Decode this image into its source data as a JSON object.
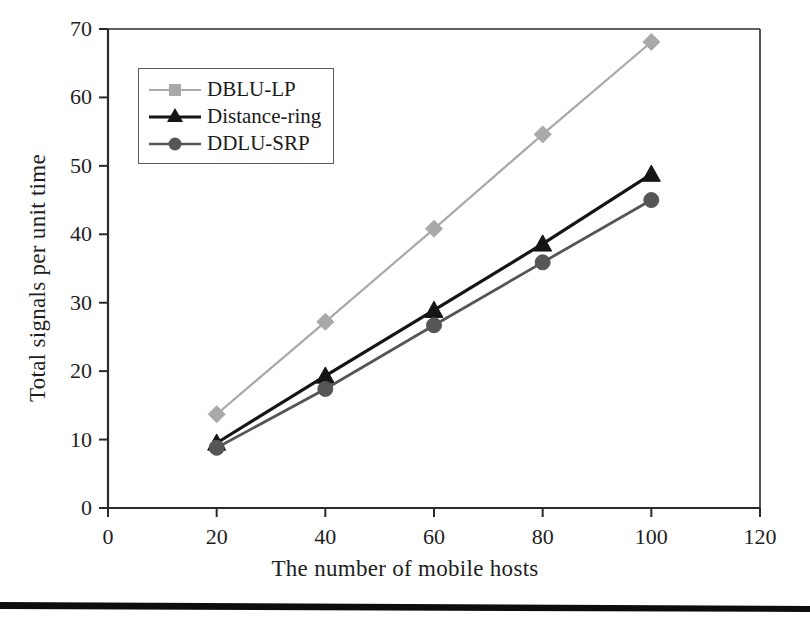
{
  "figure": {
    "background_color": "#ffffff",
    "axis_color": "#2a2a2a"
  },
  "chart_data": {
    "type": "line",
    "title": "",
    "xlabel": "The number of mobile hosts",
    "ylabel": "Total signals per unit time",
    "x": [
      20,
      40,
      60,
      80,
      100
    ],
    "xlim": [
      0,
      120
    ],
    "ylim": [
      0,
      70
    ],
    "xticks": [
      0,
      20,
      40,
      60,
      80,
      100,
      120
    ],
    "yticks": [
      0,
      10,
      20,
      30,
      40,
      50,
      60,
      70
    ],
    "grid": false,
    "legend_position": "upper-left-inside",
    "series": [
      {
        "name": "DBLU-LP",
        "values": [
          13.7,
          27.2,
          40.8,
          54.6,
          68.1
        ],
        "color": "#a9a9a9",
        "marker": "diamond"
      },
      {
        "name": "Distance-ring",
        "values": [
          9.5,
          19.3,
          28.9,
          38.6,
          48.8
        ],
        "color": "#151515",
        "marker": "triangle"
      },
      {
        "name": "DDLU-SRP",
        "values": [
          8.8,
          17.4,
          26.7,
          35.9,
          45.0
        ],
        "color": "#565656",
        "marker": "circle"
      }
    ]
  },
  "legend": {
    "entries": [
      {
        "label": "DBLU-LP"
      },
      {
        "label": "Distance-ring"
      },
      {
        "label": "DDLU-SRP"
      }
    ]
  },
  "ticks": {
    "x": [
      "0",
      "20",
      "40",
      "60",
      "80",
      "100",
      "120"
    ],
    "y": [
      "0",
      "10",
      "20",
      "30",
      "40",
      "50",
      "60",
      "70"
    ]
  },
  "footer": {
    "rule_color": "#0d0d0d"
  }
}
